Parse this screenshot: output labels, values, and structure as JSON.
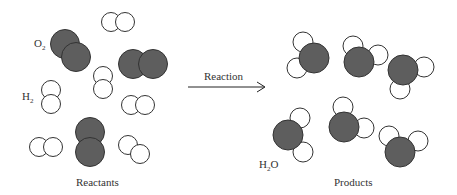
{
  "colors": {
    "oxygen_fill": "#5e5e5e",
    "hydrogen_fill": "#ffffff",
    "outline": "#333333"
  },
  "labels": {
    "o2": {
      "main": "O",
      "sub": "2"
    },
    "h2": {
      "main": "H",
      "sub": "2"
    },
    "h2o": {
      "main": "H",
      "sub": "2",
      "tail": "O"
    },
    "reactants": "Reactants",
    "products": "Products",
    "reaction": "Reaction"
  },
  "reactants": {
    "o2_molecules": [
      [
        [
          65,
          44
        ],
        [
          76,
          57
        ]
      ],
      [
        [
          133,
          64
        ],
        [
          153,
          64
        ]
      ],
      [
        [
          90,
          132
        ],
        [
          90,
          152
        ]
      ]
    ],
    "h2_molecules": [
      [
        [
          111,
          22
        ],
        [
          125,
          22
        ]
      ],
      [
        [
          51,
          90
        ],
        [
          51,
          104
        ]
      ],
      [
        [
          103,
          76
        ],
        [
          103,
          89
        ]
      ],
      [
        [
          131,
          105
        ],
        [
          145,
          105
        ]
      ],
      [
        [
          39,
          147
        ],
        [
          53,
          147
        ]
      ],
      [
        [
          128,
          145
        ],
        [
          140,
          154
        ]
      ]
    ]
  },
  "products": {
    "h2o_molecules": [
      {
        "o": [
          314,
          58
        ],
        "h": [
          [
            303,
            42
          ],
          [
            297,
            68
          ]
        ]
      },
      {
        "o": [
          359,
          62
        ],
        "h": [
          [
            353,
            46
          ],
          [
            378,
            55
          ]
        ]
      },
      {
        "o": [
          403,
          70
        ],
        "h": [
          [
            424,
            67
          ],
          [
            400,
            89
          ]
        ]
      },
      {
        "o": [
          288,
          135
        ],
        "h": [
          [
            300,
            118
          ],
          [
            303,
            152
          ]
        ]
      },
      {
        "o": [
          344,
          127
        ],
        "h": [
          [
            343,
            107
          ],
          [
            364,
            128
          ]
        ]
      },
      {
        "o": [
          400,
          152
        ],
        "h": [
          [
            389,
            136
          ],
          [
            418,
            141
          ]
        ]
      }
    ]
  }
}
